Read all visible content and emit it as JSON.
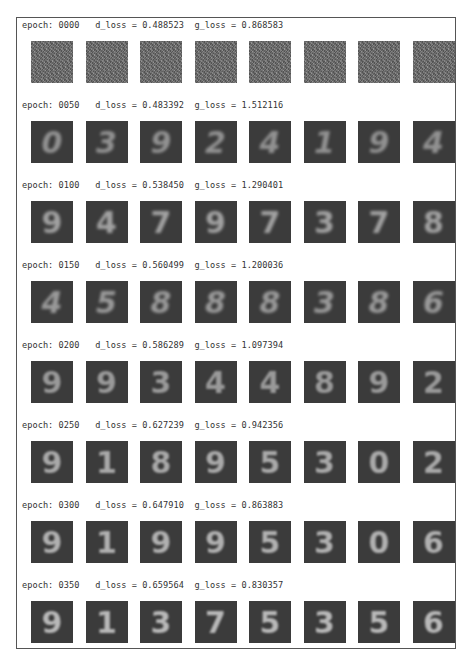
{
  "epochs": [
    {
      "epoch": "0000",
      "label": "epoch: 0000   d_loss = 0.488523  g_loss = 0.868583",
      "d_loss": "0.488523",
      "g_loss": "0.868583",
      "samples": [
        "",
        "",
        "",
        "",
        "",
        "",
        "",
        ""
      ]
    },
    {
      "epoch": "0050",
      "label": "epoch: 0050   d_loss = 0.483392  g_loss = 1.512116",
      "d_loss": "0.483392",
      "g_loss": "1.512116",
      "samples": [
        "0",
        "3",
        "9",
        "2",
        "4",
        "1",
        "9",
        "4"
      ]
    },
    {
      "epoch": "0100",
      "label": "epoch: 0100   d_loss = 0.538450  g_loss = 1.290401",
      "d_loss": "0.538450",
      "g_loss": "1.290401",
      "samples": [
        "9",
        "4",
        "7",
        "9",
        "7",
        "3",
        "7",
        "8"
      ]
    },
    {
      "epoch": "0150",
      "label": "epoch: 0150   d_loss = 0.560499  g_loss = 1.200036",
      "d_loss": "0.560499",
      "g_loss": "1.200036",
      "samples": [
        "4",
        "5",
        "8",
        "8",
        "8",
        "3",
        "8",
        "6"
      ]
    },
    {
      "epoch": "0200",
      "label": "epoch: 0200   d_loss = 0.586289  g_loss = 1.097394",
      "d_loss": "0.586289",
      "g_loss": "1.097394",
      "samples": [
        "9",
        "9",
        "3",
        "4",
        "4",
        "8",
        "9",
        "2"
      ]
    },
    {
      "epoch": "0250",
      "label": "epoch: 0250   d_loss = 0.627239  g_loss = 0.942356",
      "d_loss": "0.627239",
      "g_loss": "0.942356",
      "samples": [
        "9",
        "1",
        "8",
        "9",
        "5",
        "3",
        "0",
        "2"
      ]
    },
    {
      "epoch": "0300",
      "label": "epoch: 0300   d_loss = 0.647910  g_loss = 0.863883",
      "d_loss": "0.647910",
      "g_loss": "0.863883",
      "samples": [
        "9",
        "1",
        "9",
        "9",
        "5",
        "3",
        "0",
        "6"
      ]
    },
    {
      "epoch": "0350",
      "label": "epoch: 0350   d_loss = 0.659564  g_loss = 0.830357",
      "d_loss": "0.659564",
      "g_loss": "0.830357",
      "samples": [
        "9",
        "1",
        "3",
        "7",
        "5",
        "3",
        "5",
        "6"
      ]
    }
  ]
}
